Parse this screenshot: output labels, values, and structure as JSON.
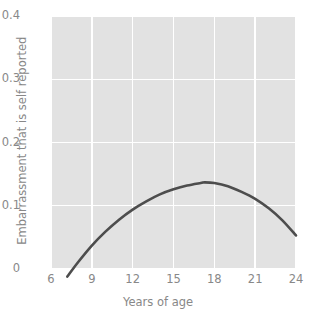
{
  "chart_data": {
    "type": "line",
    "title": "",
    "subtitle": "",
    "xlabel": "Years of age",
    "ylabel": "Embarrassment that is self reported",
    "xlim": [
      6,
      24
    ],
    "ylim": [
      0,
      0.4
    ],
    "grid": true,
    "legend": null,
    "xticks": [
      "6",
      "9",
      "12",
      "15",
      "18",
      "21",
      "24"
    ],
    "xtick_values": [
      6,
      9,
      12,
      15,
      18,
      21,
      24
    ],
    "yticks": [
      "0",
      "0.1",
      "0.2",
      "0.3",
      "0.4"
    ],
    "ytick_values": [
      0,
      0.1,
      0.2,
      0.3,
      0.4
    ],
    "series": [
      {
        "name": "Embarrassment curve",
        "color": "#4d4d4d",
        "x": [
          7.2,
          8,
          9,
          10,
          11,
          12,
          13,
          14,
          15,
          16,
          17,
          17.3,
          18,
          19,
          20,
          21,
          22,
          23,
          24
        ],
        "y": [
          -0.012,
          0.011,
          0.037,
          0.059,
          0.078,
          0.094,
          0.107,
          0.118,
          0.126,
          0.132,
          0.136,
          0.137,
          0.136,
          0.131,
          0.122,
          0.111,
          0.096,
          0.077,
          0.053
        ]
      }
    ],
    "annotations": []
  },
  "style": {
    "panel_background": "#e2e2e2",
    "gridline_color": "#ffffff",
    "text_color": "#888888",
    "line_color": "#4d4d4d",
    "page_background": "#ffffff"
  }
}
